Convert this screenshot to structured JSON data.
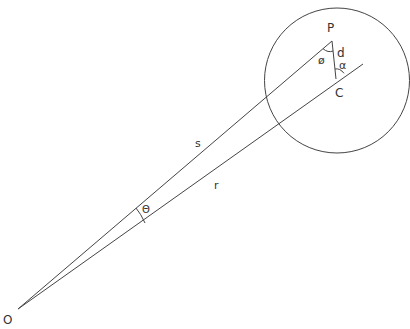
{
  "diagram": {
    "type": "geometry",
    "labels": {
      "origin": "O",
      "point_p": "P",
      "point_c": "C",
      "distance_d": "d",
      "angle_phi": "ø",
      "angle_alpha": "α",
      "angle_theta": "Θ",
      "segment_s": "s",
      "segment_r": "r"
    },
    "colors": {
      "stroke": "#444444",
      "text": "#333333",
      "background": "#ffffff"
    }
  }
}
